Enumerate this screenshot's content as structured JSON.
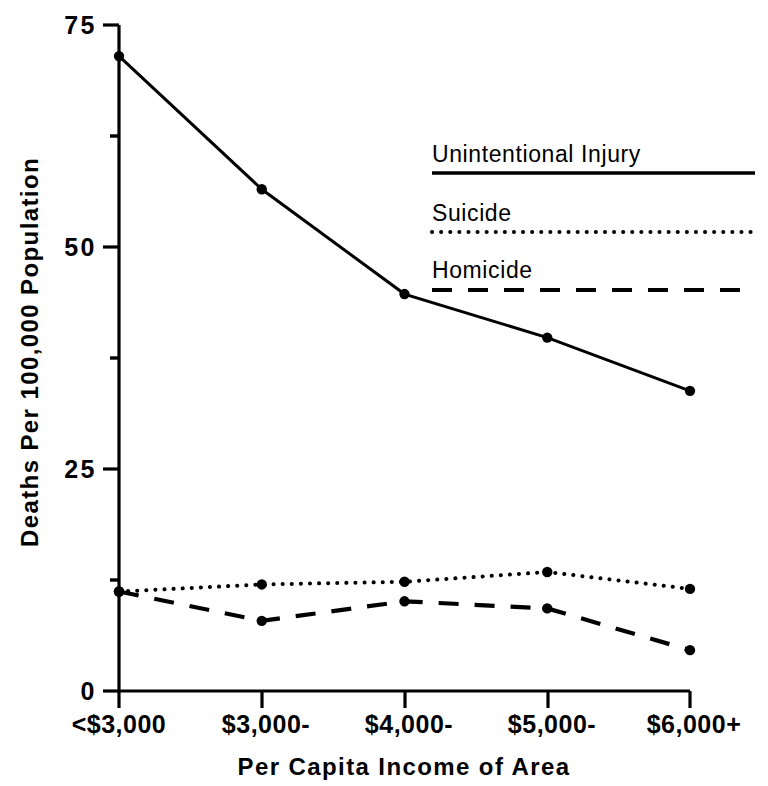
{
  "chart_data": {
    "type": "line",
    "title": "",
    "xlabel": "Per Capita Income of Area",
    "ylabel": "Deaths Per 100,000 Population",
    "categories": [
      "<$3,000",
      "$3,000-",
      "$4,000-",
      "$5,000-",
      "$6,000+"
    ],
    "ylim": [
      0,
      75
    ],
    "ytick_labels": [
      "0",
      "25",
      "50",
      "75"
    ],
    "ytick_values": [
      0,
      25,
      50,
      75
    ],
    "yminor_values": [
      12.5,
      37.5,
      62.5
    ],
    "grid": false,
    "legend_position": "upper-right-inside",
    "series": [
      {
        "name": "Unintentional Injury",
        "style": "solid",
        "values": [
          71.5,
          56.5,
          44.7,
          39.8,
          33.8
        ]
      },
      {
        "name": "Suicide",
        "style": "dotted",
        "values": [
          11.2,
          12.0,
          12.3,
          13.4,
          11.5
        ]
      },
      {
        "name": "Homicide",
        "style": "dashed",
        "values": [
          11.2,
          7.9,
          10.1,
          9.3,
          4.6
        ]
      }
    ]
  },
  "axes": {
    "y_title": "Deaths Per 100,000 Population",
    "x_title": "Per Capita Income of Area",
    "y_tick_0": "0",
    "y_tick_25": "25",
    "y_tick_50": "50",
    "y_tick_75": "75",
    "x_tick_1": "<$3,000",
    "x_tick_2": "$3,000-",
    "x_tick_3": "$4,000-",
    "x_tick_4": "$5,000-",
    "x_tick_5": "$6,000+"
  },
  "legend": {
    "entry_1": "Unintentional Injury",
    "entry_2": "Suicide",
    "entry_3": "Homicide"
  },
  "colors": {
    "ink": "#000000",
    "paper": "#ffffff"
  }
}
